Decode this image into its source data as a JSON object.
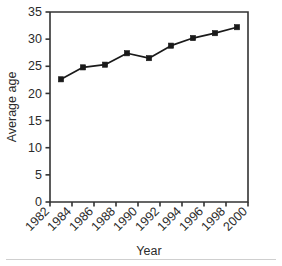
{
  "chart_data": {
    "type": "line",
    "title": "",
    "subtitle": "",
    "xlabel": "Year",
    "ylabel": "Average age",
    "xlim": [
      1982,
      2000
    ],
    "ylim": [
      0,
      35
    ],
    "xticks": [
      "1982",
      "1984",
      "1986",
      "1988",
      "1990",
      "1992",
      "1994",
      "1996",
      "1998",
      "2000"
    ],
    "xtick_values": [
      1982,
      1984,
      1986,
      1988,
      1990,
      1992,
      1994,
      1996,
      1998,
      2000
    ],
    "yticks": [
      "0",
      "5",
      "10",
      "15",
      "20",
      "25",
      "30",
      "35"
    ],
    "ytick_values": [
      0,
      5,
      10,
      15,
      20,
      25,
      30,
      35
    ],
    "grid": false,
    "legend": false,
    "legend_position": "none",
    "marker": "square",
    "line_color": "#1a1a1a",
    "marker_color": "#1a1a1a",
    "axis_color": "#333333",
    "background_color": "#ffffff",
    "x": [
      1983,
      1985,
      1987,
      1989,
      1991,
      1993,
      1995,
      1997,
      1999
    ],
    "values": [
      22.6,
      24.8,
      25.3,
      27.4,
      26.5,
      28.8,
      30.2,
      31.1,
      32.2
    ],
    "series": [
      {
        "name": "Average age",
        "x": [
          1983,
          1985,
          1987,
          1989,
          1991,
          1993,
          1995,
          1997,
          1999
        ],
        "values": [
          22.6,
          24.8,
          25.3,
          27.4,
          26.5,
          28.8,
          30.2,
          31.1,
          32.2
        ]
      }
    ]
  },
  "axes": {
    "y_label": "Average age",
    "x_label": "Year"
  }
}
